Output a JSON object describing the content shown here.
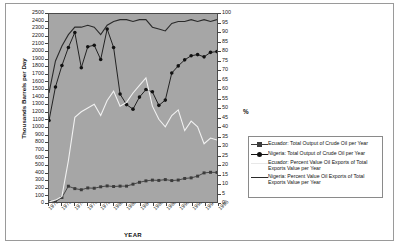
{
  "chart_data": {
    "type": "line",
    "title": "",
    "xlabel": "YEAR",
    "ylabel": "Thousands Barrels per Day",
    "y2label": "%",
    "ylim": [
      0,
      2500
    ],
    "y2lim": [
      0,
      100
    ],
    "grid": false,
    "legend_position": "right",
    "plot_background": "#a6a6a6",
    "x": [
      1970,
      1971,
      1972,
      1973,
      1974,
      1975,
      1976,
      1977,
      1978,
      1979,
      1980,
      1981,
      1982,
      1983,
      1984,
      1985,
      1986,
      1987,
      1988,
      1989,
      1990,
      1991,
      1992,
      1993,
      1994,
      1995,
      1996
    ],
    "xticks": [
      "1970",
      "1972",
      "1974",
      "1976",
      "1978",
      "1980",
      "1982",
      "1984",
      "1986",
      "1988",
      "1990",
      "1992",
      "1994",
      "1996"
    ],
    "yticks": [
      "0",
      "100",
      "200",
      "300",
      "400",
      "500",
      "600",
      "700",
      "800",
      "900",
      "1000",
      "1100",
      "1200",
      "1300",
      "1400",
      "1500",
      "1600",
      "1700",
      "1800",
      "1900",
      "2000",
      "2100",
      "2200",
      "2300",
      "2400",
      "2500"
    ],
    "y2ticks": [
      "0",
      "5",
      "10",
      "15",
      "20",
      "25",
      "30",
      "35",
      "40",
      "45",
      "50",
      "55",
      "60",
      "65",
      "70",
      "75",
      "80",
      "85",
      "90",
      "95",
      "100"
    ],
    "series": [
      {
        "name": "Ecuador: Total Output of Crude Oil per Year",
        "axis": "left",
        "color": "#3c3c3c",
        "marker": "square",
        "values": [
          4,
          4,
          60,
          210,
          178,
          163,
          187,
          183,
          202,
          214,
          206,
          211,
          211,
          237,
          262,
          281,
          291,
          287,
          298,
          285,
          292,
          313,
          321,
          344,
          387,
          395,
          393
        ]
      },
      {
        "name": "Nigeria: Total Output of Crude Oil per Year",
        "axis": "left",
        "color": "#111111",
        "marker": "circle",
        "values": [
          1084,
          1530,
          1815,
          2055,
          2255,
          1785,
          2065,
          2085,
          1895,
          2300,
          2055,
          1435,
          1295,
          1235,
          1395,
          1495,
          1465,
          1285,
          1355,
          1715,
          1810,
          1890,
          1945,
          1960,
          1930,
          1990,
          2000
        ]
      },
      {
        "name": "Ecuador: Percent Value Oil Exports of Total Exports Value per Year",
        "axis": "right",
        "color": "#f2f2f2",
        "marker": "none",
        "values": [
          0,
          1,
          3,
          22,
          45,
          48,
          50,
          52,
          46,
          54,
          59,
          51,
          53,
          58,
          62,
          66,
          51,
          44,
          40,
          46,
          49,
          38,
          43,
          40,
          31,
          34,
          33
        ]
      },
      {
        "name": "Nigeria: Percent Value Oil Exports of Total Exports Value per Year",
        "axis": "right",
        "color": "#2a2a2a",
        "marker": "none",
        "values": [
          58,
          75,
          83,
          89,
          93,
          93,
          94,
          93,
          89,
          94,
          96,
          97,
          97,
          96,
          97,
          97,
          93,
          92,
          91,
          95,
          96,
          96,
          97,
          96,
          97,
          96,
          97
        ]
      }
    ]
  },
  "legend": {
    "entries": [
      {
        "label": "Ecuador: Total Output of Crude Oil per Year",
        "marker": "square",
        "color": "#3c3c3c"
      },
      {
        "label": "Nigeria: Total Output of Crude Oil per Year",
        "marker": "circle",
        "color": "#111111"
      },
      {
        "label": "Ecuador: Percent Value Oil Exports of Total Exports Value per Year",
        "marker": "none",
        "color": "#e8e8e8"
      },
      {
        "label": "Nigeria: Percent Value Oil Exports of Total Exports Value per Year",
        "marker": "none",
        "color": "#2a2a2a"
      }
    ]
  }
}
